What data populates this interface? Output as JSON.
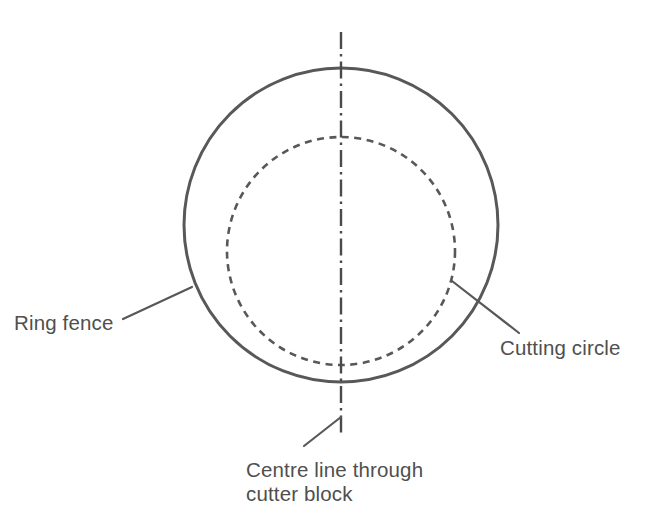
{
  "figure": {
    "type": "technical-line-diagram",
    "background_color": "#ffffff",
    "line_color": "#585858",
    "text_color": "#4f4f4f"
  },
  "labels": {
    "ring_fence": "Ring fence",
    "cutting_circle": "Cutting circle",
    "centre_line_line1": "Centre line through",
    "centre_line_line2": "cutter block"
  },
  "geometry": {
    "outer_circle": {
      "name": "ring-fence",
      "style": "solid",
      "center_x": 341,
      "center_y": 225,
      "radius": 157,
      "stroke_width": 3
    },
    "inner_circle": {
      "name": "cutting-circle",
      "style": "dashed",
      "center_x": 341,
      "center_y": 251,
      "radius": 114,
      "stroke_width": 2.6,
      "dash_pattern": "7 5.5"
    },
    "centre_line": {
      "name": "centre-line",
      "style": "dash-dot",
      "x": 341,
      "y_start": 32,
      "y_end": 433,
      "stroke_width": 2.4,
      "dash_pattern": "17 5 2.5 5"
    },
    "leader_ring_fence": {
      "x1": 123,
      "y1": 319,
      "x2": 192,
      "y2": 287
    },
    "leader_cutting_circle": {
      "x1": 452,
      "y1": 281,
      "x2": 519,
      "y2": 333
    },
    "leader_centre_line": {
      "x1": 304,
      "y1": 446,
      "x2": 341,
      "y2": 417
    }
  },
  "text_positions": {
    "ring_fence": {
      "x": 14,
      "y": 330
    },
    "cutting_circle": {
      "x": 500,
      "y": 355
    },
    "centre_line_line1": {
      "x": 246,
      "y": 477
    },
    "centre_line_line2": {
      "x": 246,
      "y": 501
    }
  }
}
